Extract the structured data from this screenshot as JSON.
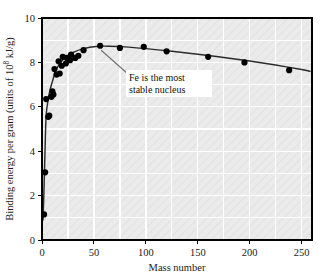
{
  "chart_data": {
    "type": "scatter",
    "title": "",
    "xlabel": "Mass number",
    "ylabel": "Binding energy per gram (units of 10^8 kJ/g)",
    "ylabel_prefix": "Binding energy per gram (units of 10",
    "ylabel_exponent": "8",
    "ylabel_suffix": " kJ/g)",
    "xlim": [
      0,
      260
    ],
    "ylim": [
      0,
      10
    ],
    "xticks": [
      0,
      50,
      100,
      150,
      200,
      250
    ],
    "xticklabels": [
      "0",
      "50",
      "100",
      "150",
      "200",
      "250"
    ],
    "yticks": [
      0,
      2,
      4,
      6,
      8,
      10
    ],
    "yticklabels": [
      "0",
      "2",
      "4",
      "6",
      "8",
      "10"
    ],
    "x_minor_step": 25,
    "y_minor_step": 1,
    "grid": true,
    "grid_color": "#ffffff",
    "plot_background": "#e9e9e9",
    "frame_color": "#000000",
    "marker_color": "#000000",
    "line_color": "#2b2b2b",
    "legend": "none",
    "annotations": [
      {
        "name": "fe-annotation",
        "line1": "Fe is the most",
        "line2": "stable nucleus",
        "points_to_x": 56,
        "points_to_y": 8.75
      }
    ],
    "points": [
      {
        "x": 2,
        "y": 1.15
      },
      {
        "x": 3,
        "y": 3.05
      },
      {
        "x": 4,
        "y": 6.35
      },
      {
        "x": 6,
        "y": 5.55
      },
      {
        "x": 7,
        "y": 5.6
      },
      {
        "x": 9,
        "y": 6.45
      },
      {
        "x": 10,
        "y": 6.7
      },
      {
        "x": 11,
        "y": 6.55
      },
      {
        "x": 12,
        "y": 7.7
      },
      {
        "x": 14,
        "y": 7.45
      },
      {
        "x": 16,
        "y": 8.05
      },
      {
        "x": 17,
        "y": 7.5
      },
      {
        "x": 19,
        "y": 7.85
      },
      {
        "x": 20,
        "y": 8.25
      },
      {
        "x": 23,
        "y": 7.95
      },
      {
        "x": 24,
        "y": 8.2
      },
      {
        "x": 27,
        "y": 8.1
      },
      {
        "x": 28,
        "y": 8.35
      },
      {
        "x": 32,
        "y": 8.2
      },
      {
        "x": 35,
        "y": 8.3
      },
      {
        "x": 40,
        "y": 8.55
      },
      {
        "x": 56,
        "y": 8.75
      },
      {
        "x": 75,
        "y": 8.65
      },
      {
        "x": 98,
        "y": 8.7
      },
      {
        "x": 120,
        "y": 8.5
      },
      {
        "x": 160,
        "y": 8.25
      },
      {
        "x": 195,
        "y": 8.0
      },
      {
        "x": 238,
        "y": 7.65
      }
    ],
    "curve": [
      {
        "x": 1,
        "y": 0.9
      },
      {
        "x": 2,
        "y": 2.4
      },
      {
        "x": 3,
        "y": 4.2
      },
      {
        "x": 4,
        "y": 5.6
      },
      {
        "x": 6,
        "y": 6.35
      },
      {
        "x": 8,
        "y": 6.8
      },
      {
        "x": 11,
        "y": 7.3
      },
      {
        "x": 14,
        "y": 7.7
      },
      {
        "x": 18,
        "y": 8.0
      },
      {
        "x": 23,
        "y": 8.25
      },
      {
        "x": 30,
        "y": 8.45
      },
      {
        "x": 40,
        "y": 8.62
      },
      {
        "x": 52,
        "y": 8.72
      },
      {
        "x": 65,
        "y": 8.73
      },
      {
        "x": 80,
        "y": 8.7
      },
      {
        "x": 100,
        "y": 8.62
      },
      {
        "x": 125,
        "y": 8.5
      },
      {
        "x": 150,
        "y": 8.37
      },
      {
        "x": 175,
        "y": 8.22
      },
      {
        "x": 200,
        "y": 8.06
      },
      {
        "x": 225,
        "y": 7.88
      },
      {
        "x": 250,
        "y": 7.68
      },
      {
        "x": 258,
        "y": 7.6
      }
    ]
  }
}
